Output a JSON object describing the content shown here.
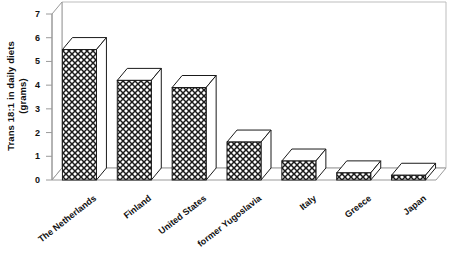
{
  "chart_data": {
    "type": "bar",
    "title": "",
    "subtitle": "",
    "xlabel": "",
    "ylabel": "Trans 18:1 in daily diets (grams)",
    "ylabel_lines": [
      "Trans 18:1 in daily diets",
      "(grams)"
    ],
    "categories": [
      "The Netherlands",
      "Finland",
      "United States",
      "former Yugoslavia",
      "Italy",
      "Greece",
      "Japan"
    ],
    "values": [
      5.5,
      4.2,
      3.9,
      1.6,
      0.8,
      0.3,
      0.2
    ],
    "ylim": [
      0,
      7
    ],
    "yticks": [
      0,
      1,
      2,
      3,
      4,
      5,
      6,
      7
    ],
    "ytick_labels": [
      "0",
      "1",
      "2",
      "3",
      "4",
      "5",
      "6",
      "7"
    ],
    "grid": false,
    "legend": "none",
    "style": "3d-bars-crosshatch",
    "bar_fill": "#ffffff",
    "bar_pattern": "crosshatch",
    "bar_edge": "#1a1a1a",
    "axis_color": "#9a9a9a",
    "plot_border_color": "#bdbdbd",
    "background": "#ffffff"
  },
  "figure": {
    "caption": ""
  }
}
